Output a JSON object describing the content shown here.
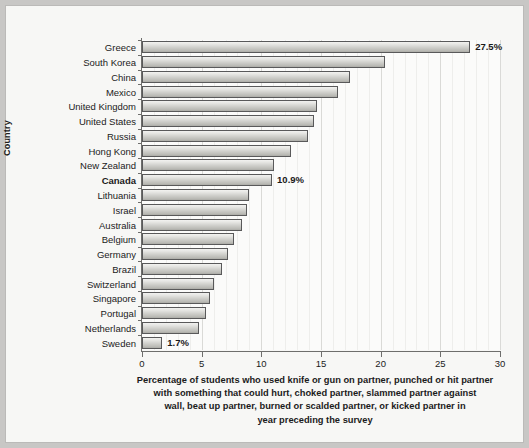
{
  "chart_data": {
    "type": "bar",
    "orientation": "horizontal",
    "title": "",
    "subtitle": "",
    "xlabel": "Percentage of students who used knife or gun on partner, punched or hit partner with something that could hurt, choked partner, slammed partner against wall, beat up partner, burned or scalded partner, or kicked partner in year preceding the survey",
    "ylabel": "Country",
    "xlim": [
      0,
      30
    ],
    "xticks": [
      0,
      5,
      10,
      15,
      20,
      25,
      30
    ],
    "xtick_labels": [
      "0",
      "5",
      "10",
      "15",
      "20",
      "25",
      "30"
    ],
    "grid": "vertical-minor",
    "legend": null,
    "categories": [
      "Greece",
      "South Korea",
      "China",
      "Mexico",
      "United Kingdom",
      "United States",
      "Russia",
      "Hong Kong",
      "New Zealand",
      "Canada",
      "Lithuania",
      "Israel",
      "Australia",
      "Belgium",
      "Germany",
      "Brazil",
      "Switzerland",
      "Singapore",
      "Portugal",
      "Netherlands",
      "Sweden"
    ],
    "values": [
      27.5,
      20.4,
      17.4,
      16.4,
      14.7,
      14.4,
      13.9,
      12.5,
      11.1,
      10.9,
      9.0,
      8.8,
      8.4,
      7.7,
      7.2,
      6.7,
      6.0,
      5.7,
      5.4,
      4.8,
      1.7
    ],
    "annotations": [
      {
        "category": "Greece",
        "text": "27.5%"
      },
      {
        "category": "Canada",
        "text": "10.9%"
      },
      {
        "category": "Sweden",
        "text": "1.7%"
      }
    ],
    "highlighted_categories": [
      "Canada"
    ],
    "colors": {
      "bar_fill_light": "#f2f2f0",
      "bar_fill_dark": "#ababa6",
      "bar_stroke": "#59595a",
      "axis": "#6e6e6c",
      "text": "#1b1b1b",
      "plot_background": "#fbfbfa",
      "figure_background": "#f7f7f5",
      "page_background": "#c8c7c5",
      "gridline": "#e2e2e0"
    }
  },
  "axis_titles": {
    "y": "Country",
    "x_caption_lines": [
      "Percentage of students who used knife or gun on partner, punched or hit partner",
      "with something that could hurt, choked partner, slammed partner against",
      "wall, beat up partner, burned or scalded partner, or kicked partner in",
      "year preceding the survey"
    ]
  }
}
